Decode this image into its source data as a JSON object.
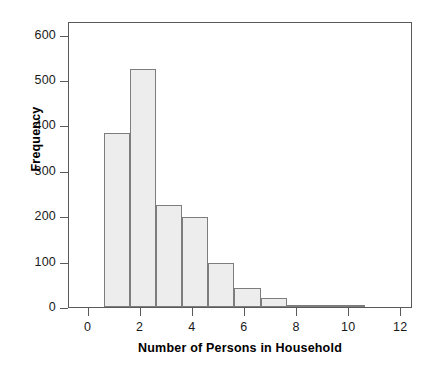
{
  "chart_data": {
    "type": "bar",
    "title": "",
    "subtitle": "",
    "xlabel": "Number of Persons in Household",
    "ylabel": "Frequency",
    "xlim": [
      -0.75,
      12.45
    ],
    "ylim": [
      0,
      630
    ],
    "grid": false,
    "legend": null,
    "bin_width": 1,
    "bin_starts": [
      0.6,
      1.6,
      2.6,
      3.6,
      4.6,
      5.6,
      6.6,
      7.6,
      8.6,
      9.6
    ],
    "categories": [
      "1",
      "2",
      "3",
      "4",
      "5",
      "6",
      "7",
      "8",
      "9",
      "10"
    ],
    "values": [
      383,
      525,
      225,
      199,
      96,
      42,
      19,
      5,
      2,
      2
    ],
    "xticks": [
      0,
      2,
      4,
      6,
      8,
      10,
      12
    ],
    "xtick_labels": [
      "0",
      "2",
      "4",
      "6",
      "8",
      "10",
      "12"
    ],
    "yticks": [
      0,
      100,
      200,
      300,
      400,
      500,
      600
    ],
    "ytick_labels": [
      "0",
      "100",
      "200",
      "300",
      "400",
      "500",
      "600"
    ],
    "colors": {
      "bar_fill": "#ededed",
      "bar_edge": "#7d7d7d",
      "axis": "#5a5a5a",
      "text": "#1a1a1a",
      "background": "#ffffff"
    }
  }
}
